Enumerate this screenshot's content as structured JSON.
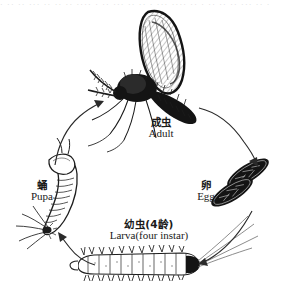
{
  "figure": {
    "title_cn": "",
    "title_en": "",
    "background_color": "#ffffff",
    "ink_color": "#141414",
    "scan_artifact_text": "· ·· ·· ··· ·· ·· ·· ···· · ·· ··· ·· ·· · ··· ···· ·· · ·· ·· ·· ··· ·· ·",
    "cycle_direction": "clockwise"
  },
  "stages": [
    {
      "id": "adult",
      "cn": "成虫",
      "en": "Adult",
      "position": "top"
    },
    {
      "id": "egg",
      "cn": "卵",
      "en": "Egg",
      "position": "right"
    },
    {
      "id": "larva",
      "cn": "幼虫(4龄)",
      "en": "Larva(four instar)",
      "position": "bottom"
    },
    {
      "id": "pupa",
      "cn": "蛹",
      "en": "Pupa",
      "position": "left"
    }
  ],
  "arrows": [
    {
      "id": "pupa-to-adult",
      "from": "pupa",
      "to": "adult"
    },
    {
      "id": "adult-to-egg",
      "from": "adult",
      "to": "egg"
    },
    {
      "id": "egg-to-larva",
      "from": "egg",
      "to": "larva"
    },
    {
      "id": "larva-to-pupa",
      "from": "larva",
      "to": "pupa"
    }
  ]
}
